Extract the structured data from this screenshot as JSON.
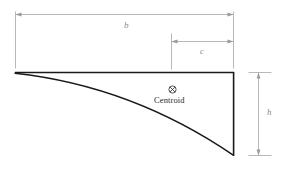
{
  "figure": {
    "background_color": "#ffffff",
    "outline_color": "#1a1a1a",
    "dimension_color": "#9a9a9a",
    "label_color": "#8a8a8a",
    "centroid_color": "#2b2b2b"
  },
  "dimensions": [
    {
      "key": "b",
      "label": "b",
      "orientation": "horizontal",
      "description": "overall base width"
    },
    {
      "key": "c",
      "label": "c",
      "orientation": "horizontal",
      "description": "centroid offset from right edge"
    },
    {
      "key": "h",
      "label": "h",
      "orientation": "vertical",
      "description": "overall height"
    }
  ],
  "annotations": {
    "centroid_label": "Centroid",
    "centroid_marker": "circle-x-icon"
  },
  "icons": {
    "arrow_left": "arrow-left-icon",
    "arrow_right": "arrow-right-icon",
    "arrow_up": "arrow-up-icon",
    "arrow_down": "arrow-down-icon"
  }
}
